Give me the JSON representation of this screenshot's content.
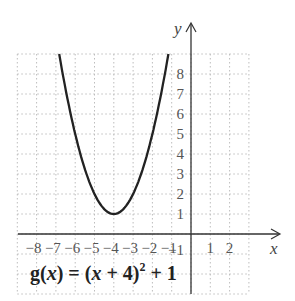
{
  "chart_data": {
    "type": "line",
    "title": "",
    "equation_label": "g(x) = (x + 4)² + 1",
    "equation_parts": {
      "fn": "g",
      "arg": "x",
      "eq": " = (",
      "inner": "x",
      "plus4": " + 4)",
      "exp": "2",
      "tail": " + 1"
    },
    "xlabel": "x",
    "ylabel": "y",
    "xlim": [
      -9,
      3
    ],
    "ylim": [
      -3,
      9
    ],
    "x_ticks": [
      "-8",
      "-7",
      "-6",
      "-5",
      "-4",
      "-3",
      "-2",
      "-1",
      "1",
      "2"
    ],
    "y_ticks": [
      "8",
      "7",
      "6",
      "5",
      "4",
      "3",
      "2",
      "1",
      "-1"
    ],
    "grid": true,
    "series": [
      {
        "name": "g(x) = (x + 4)^2 + 1",
        "x": [
          -6.83,
          -6,
          -5,
          -4,
          -3,
          -2,
          -1.17
        ],
        "values": [
          9,
          5,
          2,
          1,
          2,
          5,
          9
        ]
      }
    ],
    "vertex": {
      "x": -4,
      "y": 1
    }
  },
  "colors": {
    "curve": "#222222",
    "axis": "#333333",
    "grid": "#bdbdbd"
  }
}
